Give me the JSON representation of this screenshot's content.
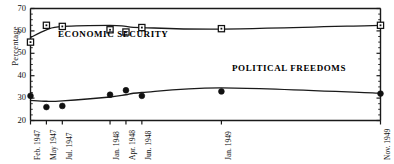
{
  "chart_data": {
    "type": "line",
    "title": "",
    "xlabel": "",
    "ylabel": "Percentage",
    "ylim": [
      20,
      70
    ],
    "yticks": [
      20,
      30,
      40,
      50,
      60,
      70
    ],
    "grid": false,
    "legend_position": "inline-annotation",
    "categories": [
      "Feb. 1947",
      "May 1947",
      "Jul. 1947",
      "Jan. 1948",
      "Apr. 1948",
      "Jun. 1948",
      "Jan. 1949",
      "Nov. 1949"
    ],
    "category_positions": [
      0,
      1,
      2,
      5,
      6,
      7,
      12,
      22
    ],
    "series": [
      {
        "name": "ECONOMIC  SECURITY",
        "marker": "open-square",
        "values": [
          55,
          62.5,
          62,
          60.5,
          59.5,
          61.5,
          61,
          62.5
        ],
        "trend": [
          57,
          60.5,
          62,
          62.5,
          62,
          61.5,
          60.8,
          62.5
        ]
      },
      {
        "name": "POLITICAL  FREEDOMS",
        "marker": "filled-diamond",
        "values": [
          31,
          26,
          26.5,
          31.5,
          33.5,
          31,
          33,
          32
        ],
        "trend": [
          29,
          28.6,
          28.8,
          30.5,
          31.5,
          32.5,
          34.6,
          32.2
        ]
      }
    ]
  },
  "axis": {
    "y_label": "Percentage",
    "y_ticks": [
      "70",
      "60",
      "50",
      "40",
      "30",
      "20"
    ],
    "x_ticks": [
      "Feb. 1947",
      "May 1947",
      "Jul. 1947",
      "Jan. 1948",
      "Apr. 1948",
      "Jun. 1948",
      "Jan. 1949",
      "Nov. 1949"
    ]
  },
  "annotations": {
    "economic": "ECONOMIC  SECURITY",
    "political": "POLITICAL  FREEDOMS"
  },
  "colors": {
    "axis": "#1a1a1a",
    "line": "#1a1a1a",
    "marker_fill_open": "#ffffff",
    "marker_fill_solid": "#111111",
    "background": "#ffffff"
  }
}
